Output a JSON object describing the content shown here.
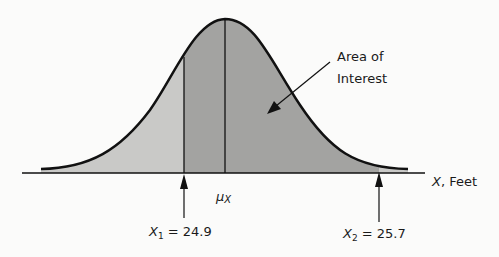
{
  "figure": {
    "type": "normal-distribution-shaded-area",
    "annotation": {
      "line1": "Area of",
      "line2": "Interest"
    },
    "axis_label": {
      "var": "X",
      "unit": ", Feet"
    },
    "mean_label": {
      "symbol": "μ",
      "subscript": "X"
    },
    "x1": {
      "var": "X",
      "sub": "1",
      "text": " = 24.9",
      "value": 24.9
    },
    "x2": {
      "var": "X",
      "sub": "2",
      "text": " = 25.7",
      "value": 25.7
    },
    "colors": {
      "light_fill": "#c9c9c7",
      "dark_fill": "#a3a3a1",
      "stroke": "#111111"
    }
  }
}
